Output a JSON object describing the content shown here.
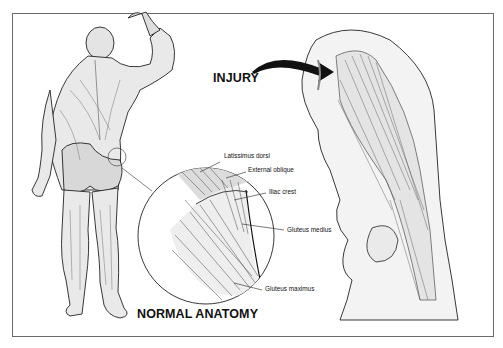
{
  "diagram": {
    "title_injury": "INJURY",
    "title_normal": "NORMAL ANATOMY",
    "callouts": [
      {
        "id": "latissimus",
        "label": "Latissimus dorsi"
      },
      {
        "id": "external-oblique",
        "label": "External oblique"
      },
      {
        "id": "iliac-crest",
        "label": "Iliac crest"
      },
      {
        "id": "gluteus-medius",
        "label": "Gluteus medius"
      },
      {
        "id": "gluteus-maximus",
        "label": "Gluteus maximus"
      }
    ],
    "colors": {
      "ink": "#111111",
      "frame": "#6a6a6a",
      "background": "#ffffff"
    }
  }
}
